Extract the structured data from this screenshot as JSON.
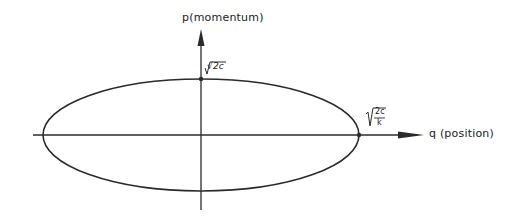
{
  "diagram": {
    "type": "phase-space ellipse",
    "axes": {
      "vertical_label": "p(momentum)",
      "horizontal_label": "q (position)"
    },
    "intercepts": {
      "p_intercept": "√2c",
      "q_intercept_num": "2c",
      "q_intercept_den": "k"
    },
    "colors": {
      "line": "#2a2a2a",
      "background": "#ffffff"
    }
  }
}
